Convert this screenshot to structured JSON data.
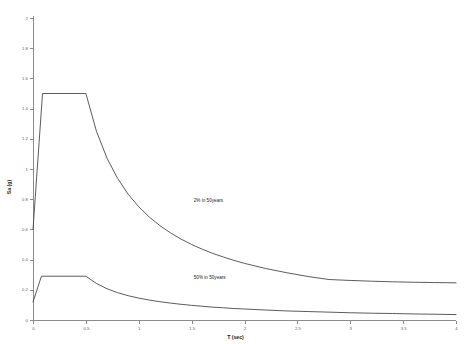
{
  "chart_data": {
    "type": "line",
    "title": "",
    "subtitle": "",
    "xlabel": "T (sec)",
    "ylabel": "Sa (g)",
    "xlim": [
      0,
      4
    ],
    "ylim": [
      0,
      2
    ],
    "grid": false,
    "legend_position": "inline-annotation",
    "xticks": [
      "0",
      "0.5",
      "1",
      "1.5",
      "2",
      "2.5",
      "3",
      "3.5",
      "4"
    ],
    "xtick_values": [
      0,
      0.5,
      1,
      1.5,
      2,
      2.5,
      3,
      3.5,
      4
    ],
    "yticks": [
      "0",
      "0.2",
      "0.4",
      "0.6",
      "0.8",
      "1",
      "1.2",
      "1.4",
      "1.6",
      "1.8",
      "2"
    ],
    "ytick_values": [
      0,
      0.2,
      0.4,
      0.6,
      0.8,
      1,
      1.2,
      1.4,
      1.6,
      1.8,
      2
    ],
    "series": [
      {
        "name": "2% in 50years",
        "label": "2% in 50years",
        "color": "#4a4a4a",
        "annotation": {
          "text": "2% in 50years",
          "x": 1.52,
          "y": 0.78
        },
        "x": [
          0,
          0.09,
          0.5,
          0.6,
          0.7,
          0.8,
          0.9,
          1.0,
          1.1,
          1.2,
          1.3,
          1.4,
          1.5,
          1.6,
          1.7,
          1.8,
          1.9,
          2.0,
          2.2,
          2.4,
          2.6,
          2.8,
          3.0,
          3.2,
          3.4,
          3.6,
          3.8,
          4.0
        ],
        "y": [
          0.6,
          1.5,
          1.5,
          1.25,
          1.071,
          0.938,
          0.833,
          0.75,
          0.682,
          0.625,
          0.577,
          0.536,
          0.5,
          0.469,
          0.441,
          0.417,
          0.395,
          0.375,
          0.341,
          0.313,
          0.288,
          0.268,
          0.262,
          0.257,
          0.253,
          0.25,
          0.248,
          0.246
        ]
      },
      {
        "name": "50% in 50years",
        "label": "50% in 50years",
        "color": "#4a4a4a",
        "annotation": {
          "text": "50% in 50years",
          "x": 1.52,
          "y": 0.27
        },
        "x": [
          0,
          0.08,
          0.5,
          0.6,
          0.7,
          0.8,
          0.9,
          1.0,
          1.1,
          1.2,
          1.3,
          1.4,
          1.5,
          1.6,
          1.7,
          1.8,
          1.9,
          2.0,
          2.2,
          2.4,
          2.6,
          2.8,
          3.0,
          3.2,
          3.4,
          3.6,
          3.8,
          4.0
        ],
        "y": [
          0.12,
          0.29,
          0.29,
          0.242,
          0.207,
          0.181,
          0.161,
          0.145,
          0.132,
          0.121,
          0.112,
          0.104,
          0.097,
          0.091,
          0.085,
          0.081,
          0.076,
          0.073,
          0.066,
          0.06,
          0.056,
          0.052,
          0.048,
          0.045,
          0.043,
          0.04,
          0.038,
          0.036
        ]
      }
    ]
  }
}
